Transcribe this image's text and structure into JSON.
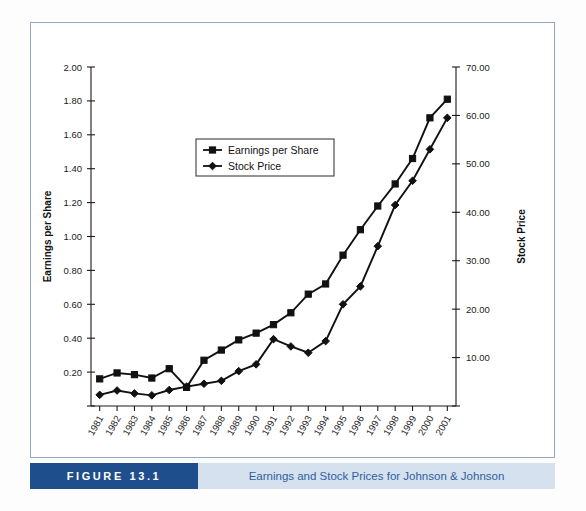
{
  "figure": {
    "tag_label": "FIGURE 13.1",
    "caption": "Earnings and Stock Prices for Johnson & Johnson",
    "tag_bg_color": "#1f4e8c",
    "caption_bg_color": "#d6e1ef",
    "caption_text_color": "#2f5f9e",
    "frame_border_color": "#93a8c4"
  },
  "chart_data": {
    "type": "line",
    "title": "",
    "xlabel": "",
    "ylabel": "Earnings per Share",
    "y2label": "Stock Price",
    "grid": false,
    "legend_position": "inside-upper-left",
    "categories": [
      "1981",
      "1982",
      "1983",
      "1984",
      "1985",
      "1986",
      "1987",
      "1988",
      "1989",
      "1990",
      "1991",
      "1992",
      "1993",
      "1994",
      "1995",
      "1996",
      "1997",
      "1998",
      "1999",
      "2000",
      "2001"
    ],
    "yticks": [
      "0.00",
      "0.20",
      "0.40",
      "0.60",
      "0.80",
      "1.00",
      "1.20",
      "1.40",
      "1.60",
      "1.80",
      "2.00"
    ],
    "yticks_visible": [
      "0.20",
      "0.40",
      "0.60",
      "0.80",
      "1.00",
      "1.20",
      "1.40",
      "1.60",
      "1.80",
      "2.00"
    ],
    "y2ticks": [
      "0.00",
      "10.00",
      "20.00",
      "30.00",
      "40.00",
      "50.00",
      "60.00",
      "70.00"
    ],
    "y2ticks_visible": [
      "10.00",
      "20.00",
      "30.00",
      "40.00",
      "50.00",
      "60.00",
      "70.00"
    ],
    "ylim": [
      0.0,
      2.0
    ],
    "y2lim": [
      0.0,
      70.0
    ],
    "series": [
      {
        "name": "Earnings per Share",
        "axis": "left",
        "marker": "square",
        "color": "#111111",
        "values": [
          0.16,
          0.195,
          0.185,
          0.165,
          0.22,
          0.11,
          0.27,
          0.33,
          0.39,
          0.43,
          0.48,
          0.55,
          0.66,
          0.72,
          0.89,
          1.04,
          1.18,
          1.31,
          1.46,
          1.7,
          1.81
        ]
      },
      {
        "name": "Stock Price",
        "axis": "right",
        "marker": "diamond",
        "color": "#111111",
        "values": [
          2.3,
          3.2,
          2.6,
          2.2,
          3.3,
          4.0,
          4.6,
          5.2,
          7.2,
          8.6,
          13.8,
          12.3,
          11.0,
          13.4,
          21.0,
          24.7,
          33.0,
          41.5,
          46.5,
          53.0,
          59.5
        ]
      }
    ]
  }
}
